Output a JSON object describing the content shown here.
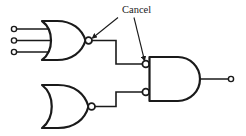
{
  "diagram": {
    "background_color": "#ffffff",
    "ink_color": "#1a1a1a",
    "annotation": {
      "label": "Cancel",
      "font_size_px": 9,
      "text_x": 122,
      "text_y": 13,
      "leaders": [
        {
          "name": "leader-to-nor-output-bubble",
          "from_x": 118,
          "from_y": 17,
          "to_x": 90,
          "to_y": 40,
          "arrowhead": "to"
        },
        {
          "name": "leader-to-and-input-bubble",
          "from_x": 134,
          "from_y": 17,
          "to_x": 144,
          "to_y": 62,
          "arrowhead": "to"
        }
      ]
    },
    "gates": [
      {
        "id": "nor-gate-top",
        "type": "NOR",
        "inputs": 3,
        "x": 42,
        "y": 21,
        "width": 43,
        "height": 39,
        "output_bubble": {
          "cx": 88,
          "cy": 40,
          "r": 3.4
        },
        "input_leads": [
          {
            "name": "input-terminal-1",
            "terminal_x": 14,
            "terminal_y": 29,
            "lead_to_x": 50
          },
          {
            "name": "input-terminal-2",
            "terminal_x": 14,
            "terminal_y": 40,
            "lead_to_x": 50
          },
          {
            "name": "input-terminal-3",
            "terminal_x": 14,
            "terminal_y": 52,
            "lead_to_x": 50
          }
        ],
        "terminal_radius": 2.6
      },
      {
        "id": "nor-gate-bottom",
        "type": "NOR",
        "inputs": 0,
        "x": 42,
        "y": 85,
        "width": 46,
        "height": 43,
        "output_bubble": {
          "cx": 91,
          "cy": 106,
          "r": 3.4
        },
        "input_leads": [],
        "terminal_radius": 2.6
      },
      {
        "id": "and-gate-output",
        "type": "AND",
        "inputs": 2,
        "inverted_inputs": true,
        "x": 149,
        "y": 57,
        "width": 53,
        "height": 44,
        "input_bubbles": [
          {
            "name": "and-input-bubble-top",
            "cx": 145.6,
            "cy": 64,
            "r": 3.4
          },
          {
            "name": "and-input-bubble-bottom",
            "cx": 145.6,
            "cy": 92,
            "r": 3.4
          }
        ],
        "output_terminal": {
          "cx": 231,
          "cy": 79,
          "r": 2.6
        },
        "output_lead_from_x": 202,
        "output_lead_to_x": 228
      }
    ],
    "wires": [
      {
        "name": "wire-nor-top-to-and-top-input",
        "points": "92,40 116,40 116,64 142,64"
      },
      {
        "name": "wire-nor-bottom-to-and-bottom-input",
        "points": "95,106 116,106 116,92 142,92"
      }
    ]
  }
}
